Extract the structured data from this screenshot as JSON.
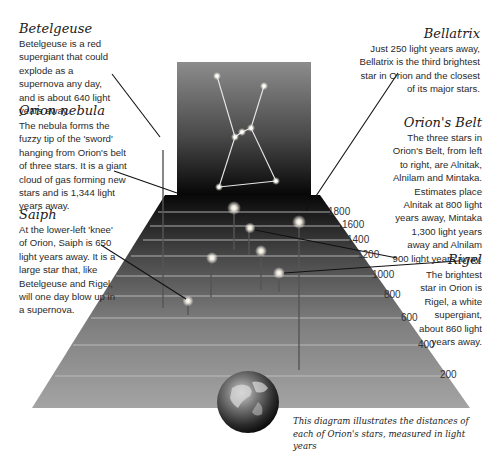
{
  "stars": [
    {
      "id": "betelgeuse",
      "title": "Betelgeuse",
      "text": "Betelgeuse is a red supergiant that could explode as a supernova any day, and is about 640 light years away.",
      "distance_ly": 640
    },
    {
      "id": "orion-nebula",
      "title": "Orion nebula",
      "text": "The nebula forms the fuzzy tip of the 'sword' hanging from Orion's belt of three stars. It is a giant cloud of gas forming new stars and is 1,344 light years away.",
      "distance_ly": 1344
    },
    {
      "id": "saiph",
      "title": "Saiph",
      "text": "At the lower-left 'knee' of Orion, Saiph is 650 light years away. It is a large star that, like Betelgeuse and Rigel, will one day blow up in a supernova.",
      "distance_ly": 650
    },
    {
      "id": "bellatrix",
      "title": "Bellatrix",
      "text": "Just 250 light years away, Bellatrix is the third brightest star in Orion and the closest of its major stars.",
      "distance_ly": 250
    },
    {
      "id": "orions-belt",
      "title": "Orion's Belt",
      "text": "The three stars in Orion's Belt, from left to right, are Alnitak, Alnilam and Mintaka. Estimates place Alnitak at 800 light years away, Mintaka 1,300 light years away and Alnilam 900 light years away.",
      "distances_ly": {
        "Alnitak": 800,
        "Mintaka": 1300,
        "Alnilam": 900
      }
    },
    {
      "id": "rigel",
      "title": "Rigel",
      "text": "The brightest star in Orion is Rigel, a white supergiant, about 860 light years away.",
      "distance_ly": 860
    }
  ],
  "scale": {
    "unit": "light years",
    "ticks": [
      "1800",
      "1600",
      "1400",
      "1200",
      "1000",
      "800",
      "600",
      "400",
      "200"
    ]
  },
  "caption": "This diagram illustrates the distances of each of Orion's stars, measured in light years",
  "colors": {
    "backdrop_top": "#8a8a8a",
    "backdrop_bottom": "#0a0a0a",
    "floor_far": "#0c0c0c",
    "floor_near": "#9a9a9a",
    "grid_line": "#c8c8c8",
    "star_glow": "#ffffff",
    "leader_line": "#111111"
  }
}
